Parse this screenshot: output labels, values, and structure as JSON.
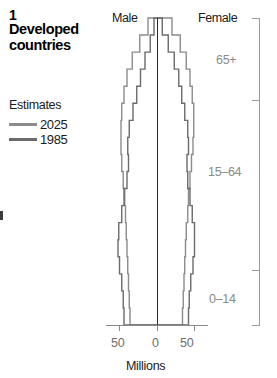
{
  "panel": {
    "number": "1",
    "title_line1": "Developed",
    "title_line2": "countries"
  },
  "legend": {
    "title": "Estimates",
    "items": [
      {
        "label": "2025",
        "color": "#8c8c8c"
      },
      {
        "label": "1985",
        "color": "#6b6b6b"
      }
    ]
  },
  "chart_labels": {
    "male": "Male",
    "female": "Female",
    "x_caption": "Millions",
    "x_ticks": [
      "50",
      "0",
      "50"
    ],
    "age_groups": [
      "65+",
      "15–64",
      "0–14"
    ]
  },
  "chart_data": {
    "type": "bar",
    "title": "Developed countries",
    "subtitle": "Estimates",
    "xlabel": "Millions",
    "ylabel": "",
    "orientation": "population-pyramid",
    "grid": false,
    "legend_position": "left",
    "xlim": [
      -60,
      60
    ],
    "x_tick_values": [
      -50,
      0,
      50
    ],
    "x_tick_labels": [
      "50",
      "0",
      "50"
    ],
    "age_bracket_labels": [
      "65+",
      "15–64",
      "0–14"
    ],
    "age_brackets": [
      {
        "label": "65+",
        "bands": [
          "85+",
          "80-84",
          "75-79",
          "70-74",
          "65-69"
        ]
      },
      {
        "label": "15–64",
        "bands": [
          "60-64",
          "55-59",
          "50-54",
          "45-49",
          "40-44",
          "35-39",
          "30-34",
          "25-29",
          "20-24",
          "15-19"
        ]
      },
      {
        "label": "0–14",
        "bands": [
          "10-14",
          "5-9",
          "0-4"
        ]
      }
    ],
    "age_bands": [
      "0-4",
      "5-9",
      "10-14",
      "15-19",
      "20-24",
      "25-29",
      "30-34",
      "35-39",
      "40-44",
      "45-49",
      "50-54",
      "55-59",
      "60-64",
      "65-69",
      "70-74",
      "75-79",
      "80-84",
      "85+"
    ],
    "series": [
      {
        "name": "2025",
        "color": "#8c8c8c",
        "male": [
          36,
          37,
          38,
          39,
          40,
          41,
          42,
          43,
          45,
          47,
          48,
          48,
          47,
          44,
          40,
          33,
          23,
          12
        ],
        "female": [
          34,
          35,
          36,
          37,
          38,
          39,
          41,
          42,
          44,
          46,
          48,
          49,
          49,
          47,
          44,
          39,
          31,
          20
        ]
      },
      {
        "name": "1985",
        "color": "#6b6b6b",
        "male": [
          44,
          45,
          47,
          50,
          52,
          51,
          47,
          44,
          40,
          38,
          39,
          37,
          32,
          27,
          22,
          16,
          9,
          4
        ],
        "female": [
          42,
          43,
          45,
          48,
          50,
          50,
          47,
          44,
          41,
          40,
          42,
          41,
          37,
          33,
          29,
          23,
          15,
          7
        ]
      }
    ]
  }
}
